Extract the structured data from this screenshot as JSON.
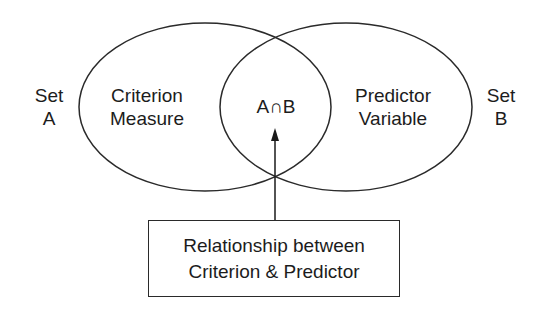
{
  "diagram": {
    "type": "venn",
    "set_a": {
      "label_line1": "Set",
      "label_line2": "A",
      "circle_line1": "Criterion",
      "circle_line2": "Measure"
    },
    "set_b": {
      "label_line1": "Set",
      "label_line2": "B",
      "circle_line1": "Predictor",
      "circle_line2": "Variable"
    },
    "intersection": {
      "label": "A∩B"
    },
    "callout": {
      "line1": "Relationship between",
      "line2": "Criterion & Predictor"
    },
    "colors": {
      "stroke": "#2a2a2a",
      "text": "#1c1c1c",
      "background": "#ffffff"
    }
  }
}
